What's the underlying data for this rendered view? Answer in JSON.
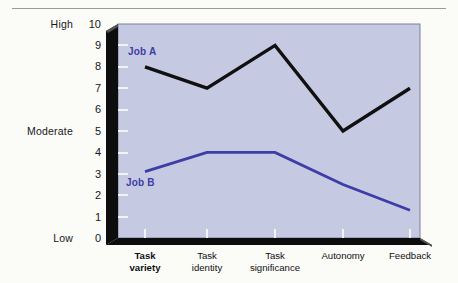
{
  "chart_data": {
    "type": "line",
    "title": "",
    "xlabel": "",
    "ylabel": "",
    "categories": [
      "Task variety",
      "Task identity",
      "Task significance",
      "Autonomy",
      "Feedback"
    ],
    "series": [
      {
        "name": "Job A",
        "color": "#101010",
        "values": [
          8.0,
          7.0,
          9.0,
          5.0,
          7.0
        ]
      },
      {
        "name": "Job B",
        "color": "#3d3da6",
        "values": [
          3.1,
          4.0,
          4.0,
          2.5,
          1.3
        ]
      }
    ],
    "ylim": [
      0,
      10
    ],
    "yticks": [
      "0",
      "1",
      "2",
      "3",
      "4",
      "5",
      "6",
      "7",
      "8",
      "9",
      "10"
    ],
    "y_anchor_labels": [
      {
        "value": 10,
        "label": "High"
      },
      {
        "value": 5,
        "label": "Moderate"
      },
      {
        "value": 0,
        "label": "Low"
      }
    ],
    "grid": false,
    "legend": "inline-annotations",
    "plot_background_color": "#c6c9e2",
    "axis_color": "#0d0d0d"
  },
  "axis": {
    "high_label": "High",
    "moderate_label": "Moderate",
    "low_label": "Low",
    "ticks": {
      "t10": "10",
      "t9": "9",
      "t8": "8",
      "t7": "7",
      "t6": "6",
      "t5": "5",
      "t4": "4",
      "t3": "3",
      "t2": "2",
      "t1": "1",
      "t0": "0"
    }
  },
  "categories": {
    "c0_line1": "Task",
    "c0_line2": "variety",
    "c1_line1": "Task",
    "c1_line2": "identity",
    "c2_line1": "Task",
    "c2_line2": "significance",
    "c3_line1": "Autonomy",
    "c3_line2": "",
    "c4_line1": "Feedback",
    "c4_line2": ""
  },
  "series_labels": {
    "job_a": "Job A",
    "job_b": "Job B"
  }
}
